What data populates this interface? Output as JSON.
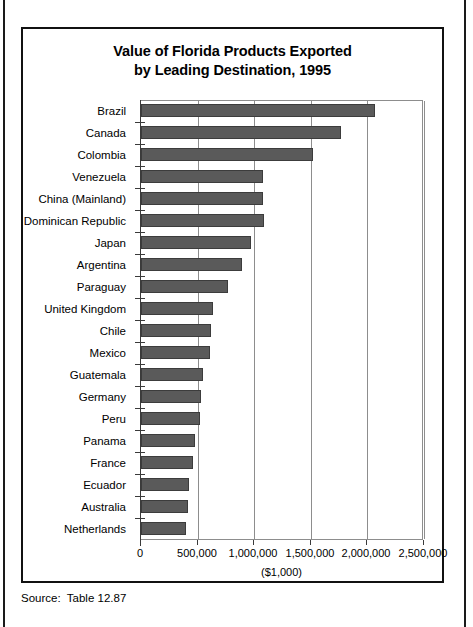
{
  "figure": {
    "title_line1": "Value of Florida Products Exported",
    "title_line2": "by Leading Destination, 1995",
    "source_note": "Source:  Table 12.87",
    "axis_caption": "($1,000)",
    "bar_color": "#5a5a5a",
    "bar_edge_color": "#3c3c3c",
    "grid_color": "#8d8d8d",
    "frame_color": "#111111"
  },
  "chart_data": {
    "type": "bar",
    "orientation": "horizontal",
    "title": "Value of Florida Products Exported by Leading Destination, 1995",
    "xlabel": "($1,000)",
    "ylabel": "",
    "xlim": [
      0,
      2500000
    ],
    "grid": true,
    "legend": null,
    "xticks": [
      0,
      500000,
      1000000,
      1500000,
      2000000,
      2500000
    ],
    "xtick_labels": [
      "0",
      "500,000",
      "1,000,000",
      "1,500,000",
      "2,000,000",
      "2,500,000"
    ],
    "categories": [
      "Brazil",
      "Canada",
      "Colombia",
      "Venezuela",
      "China (Mainland)",
      "Dominican Republic",
      "Japan",
      "Argentina",
      "Paraguay",
      "United Kingdom",
      "Chile",
      "Mexico",
      "Guatemala",
      "Germany",
      "Peru",
      "Panama",
      "France",
      "Ecuador",
      "Australia",
      "Netherlands"
    ],
    "values": [
      2070000,
      1770000,
      1520000,
      1080000,
      1080000,
      1090000,
      970000,
      890000,
      770000,
      640000,
      620000,
      610000,
      545000,
      527000,
      518000,
      473000,
      455000,
      427000,
      418000,
      400000
    ]
  }
}
